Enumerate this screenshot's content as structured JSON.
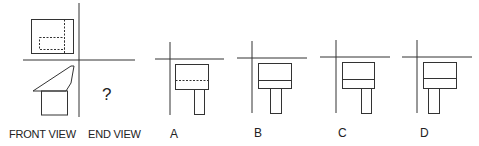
{
  "question": {
    "front_view_label": "FRONT VIEW",
    "end_view_label": "END VIEW",
    "unknown_marker": "?"
  },
  "options": [
    {
      "label": "A",
      "divider_style": "dashed",
      "stem_position": "right"
    },
    {
      "label": "B",
      "divider_style": "solid",
      "stem_position": "center"
    },
    {
      "label": "C",
      "divider_style": "solid",
      "stem_position": "right"
    },
    {
      "label": "D",
      "divider_style": "solid",
      "stem_position": "left"
    }
  ],
  "colors": {
    "line": "#333333",
    "background": "#ffffff"
  }
}
